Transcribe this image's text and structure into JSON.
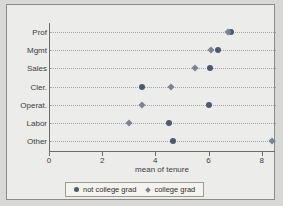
{
  "chart_data": {
    "type": "scatter",
    "title": "",
    "xlabel": "mean of tenure",
    "ylabel": "",
    "xlim": [
      0,
      8.5
    ],
    "xticks": [
      0,
      2,
      4,
      6,
      8
    ],
    "xtick_labels": [
      "0",
      "2",
      "4",
      "6",
      "8"
    ],
    "categories": [
      "Prof",
      "Mgmt",
      "Sales",
      "Cler.",
      "Operat.",
      "Labor",
      "Other"
    ],
    "grid": "horizontal-dotted",
    "legend_position": "bottom",
    "series": [
      {
        "name": "not college grad",
        "marker": "circle",
        "color": "#4d5a6b",
        "values": [
          6.85,
          6.35,
          6.05,
          3.5,
          6.0,
          4.5,
          4.65
        ]
      },
      {
        "name": "college grad",
        "marker": "diamond",
        "color": "#7b8392",
        "values": [
          6.75,
          6.1,
          5.5,
          4.6,
          3.5,
          3.0,
          8.4
        ]
      }
    ]
  },
  "legend": {
    "items": [
      {
        "label": "not college grad",
        "marker": "circle"
      },
      {
        "label": "college grad",
        "marker": "diamond"
      }
    ]
  },
  "colors": {
    "page_background": "#d8d8d6",
    "plot_background": "#ececeb",
    "frame_border": "#8a8a8a",
    "axis": "#6b6b6b",
    "gridline": "#9fa6b2",
    "legend_background": "#f4f3ee"
  }
}
